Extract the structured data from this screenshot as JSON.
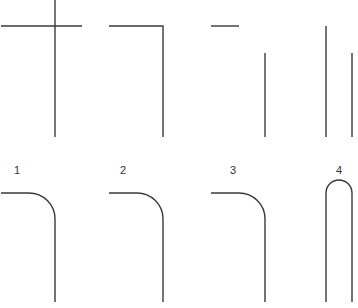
{
  "diagram": {
    "stroke_color": "#3a3a3a",
    "background": "#ffffff",
    "top_row": [
      {
        "id": "cross",
        "type": "cross-join"
      },
      {
        "id": "corner",
        "type": "square-corner"
      },
      {
        "id": "offset",
        "type": "disconnected-corner"
      },
      {
        "id": "parallel",
        "type": "parallel-lines"
      }
    ],
    "bottom_row": [
      {
        "id": "1",
        "label": "1",
        "type": "rounded-corner"
      },
      {
        "id": "2",
        "label": "2",
        "type": "rounded-corner"
      },
      {
        "id": "3",
        "label": "3",
        "type": "rounded-corner"
      },
      {
        "id": "4",
        "label": "4",
        "type": "rounded-u-turn"
      }
    ]
  }
}
